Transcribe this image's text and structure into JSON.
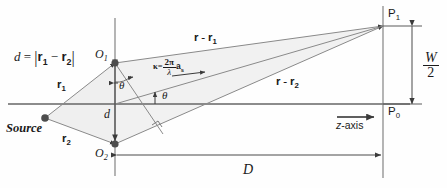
{
  "figure": {
    "type": "optics-ray-diagram",
    "colors": {
      "line": "#555555",
      "text": "#1a1a1a",
      "shade": "#f2f2f2",
      "node": "#4d4d4d",
      "axis": "#666666"
    }
  },
  "labels": {
    "separation_formula": {
      "d": "d",
      "eq": "=",
      "r1": "r",
      "r1sub": "1",
      "minus": "−",
      "r2": "r",
      "r2sub": "2"
    },
    "origin_1": {
      "text": "O",
      "sub": "1"
    },
    "origin_2": {
      "text": "O",
      "sub": "2"
    },
    "source": "Source",
    "r1": {
      "text": "r",
      "sub": "1"
    },
    "r2": {
      "text": "r",
      "sub": "2"
    },
    "d_gap": "d",
    "theta_upper": "θ",
    "theta_axis": "θ",
    "kappa": {
      "k": "κ",
      "eq": "=",
      "num": "2π",
      "den": "λ",
      "vec": "a",
      "vecsub": "s"
    },
    "path_1": {
      "r": "r",
      "minus": "-",
      "r2": "r",
      "sub": "1"
    },
    "path_2": {
      "r": "r",
      "minus": "-",
      "r2": "r",
      "sub": "2"
    },
    "screen_point_top": {
      "text": "P",
      "sub": "1"
    },
    "screen_point_center": {
      "text": "P",
      "sub": "0"
    },
    "half_width": {
      "num": "W",
      "den": "2"
    },
    "distance": "D",
    "z_axis": {
      "z": "z",
      "rest": "-axis"
    }
  },
  "geometry": {
    "origin_1": {
      "x": 115,
      "y": 63
    },
    "origin_2": {
      "x": 115,
      "y": 144
    },
    "source": {
      "x": 45,
      "y": 118
    },
    "screen_x": 383,
    "axis_y": 104,
    "p1": {
      "x": 383,
      "y": 26
    }
  }
}
